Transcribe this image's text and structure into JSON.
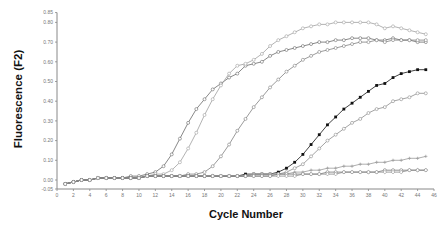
{
  "chart_data": {
    "type": "line",
    "title": "",
    "xlabel": "Cycle Number",
    "ylabel": "Fluorescence (F2)",
    "xlim": [
      0,
      46
    ],
    "ylim": [
      -0.05,
      0.85
    ],
    "grid": false,
    "legend": "none",
    "x_ticks": [
      0,
      2,
      4,
      6,
      8,
      10,
      12,
      14,
      16,
      18,
      20,
      22,
      24,
      26,
      28,
      30,
      32,
      34,
      36,
      38,
      40,
      42,
      44,
      46
    ],
    "x_tick_labels": [
      "0",
      "2",
      "4",
      "6",
      "8",
      "10",
      "12",
      "14",
      "16",
      "18",
      "20",
      "22",
      "24",
      "26",
      "28",
      "30",
      "32",
      "34",
      "36",
      "38",
      "40",
      "42",
      "44",
      "46"
    ],
    "y_ticks": [
      -0.05,
      0.0,
      0.1,
      0.2,
      0.3,
      0.4,
      0.5,
      0.6,
      0.7,
      0.8,
      0.85
    ],
    "y_tick_labels": [
      "-0.05",
      "0.00",
      "0.10",
      "0.20",
      "0.30",
      "0.40",
      "0.50",
      "0.60",
      "0.70",
      "0.80",
      "0.85"
    ],
    "x": [
      1,
      2,
      3,
      4,
      5,
      6,
      7,
      8,
      9,
      10,
      11,
      12,
      13,
      14,
      15,
      16,
      17,
      18,
      19,
      20,
      21,
      22,
      23,
      24,
      25,
      26,
      27,
      28,
      29,
      30,
      31,
      32,
      33,
      34,
      35,
      36,
      37,
      38,
      39,
      40,
      41,
      42,
      43,
      44,
      45
    ],
    "series": [
      {
        "name": "Sample A",
        "color": "#6a6a6a",
        "marker": "open-circle",
        "values": [
          -0.02,
          -0.01,
          0.0,
          0.0,
          0.01,
          0.01,
          0.01,
          0.01,
          0.02,
          0.02,
          0.03,
          0.04,
          0.07,
          0.13,
          0.21,
          0.29,
          0.36,
          0.41,
          0.46,
          0.49,
          0.52,
          0.54,
          0.58,
          0.59,
          0.6,
          0.63,
          0.65,
          0.66,
          0.67,
          0.68,
          0.69,
          0.7,
          0.7,
          0.71,
          0.71,
          0.72,
          0.72,
          0.72,
          0.71,
          0.71,
          0.72,
          0.71,
          0.71,
          0.7,
          0.7
        ]
      },
      {
        "name": "Sample B",
        "color": "#a0a0a0",
        "marker": "open-circle",
        "values": [
          -0.02,
          -0.01,
          0.0,
          0.0,
          0.01,
          0.01,
          0.01,
          0.01,
          0.01,
          0.02,
          0.02,
          0.03,
          0.03,
          0.05,
          0.09,
          0.16,
          0.24,
          0.33,
          0.41,
          0.48,
          0.54,
          0.58,
          0.59,
          0.61,
          0.64,
          0.68,
          0.71,
          0.73,
          0.75,
          0.77,
          0.78,
          0.79,
          0.79,
          0.8,
          0.8,
          0.8,
          0.8,
          0.8,
          0.79,
          0.77,
          0.78,
          0.77,
          0.76,
          0.75,
          0.74
        ]
      },
      {
        "name": "Sample C",
        "color": "#808080",
        "marker": "open-circle",
        "values": [
          -0.02,
          -0.01,
          0.0,
          0.0,
          0.01,
          0.01,
          0.01,
          0.01,
          0.01,
          0.01,
          0.02,
          0.02,
          0.02,
          0.02,
          0.02,
          0.03,
          0.03,
          0.04,
          0.07,
          0.12,
          0.18,
          0.25,
          0.31,
          0.37,
          0.42,
          0.47,
          0.51,
          0.55,
          0.58,
          0.61,
          0.63,
          0.65,
          0.66,
          0.67,
          0.68,
          0.69,
          0.7,
          0.7,
          0.71,
          0.7,
          0.71,
          0.71,
          0.71,
          0.71,
          0.71
        ]
      },
      {
        "name": "Sample D",
        "color": "#111111",
        "marker": "filled-square",
        "values": [
          -0.02,
          -0.01,
          0.0,
          0.0,
          0.01,
          0.01,
          0.01,
          0.01,
          0.01,
          0.01,
          0.02,
          0.02,
          0.02,
          0.02,
          0.02,
          0.02,
          0.02,
          0.02,
          0.02,
          0.02,
          0.02,
          0.02,
          0.03,
          0.03,
          0.03,
          0.03,
          0.04,
          0.06,
          0.09,
          0.13,
          0.18,
          0.23,
          0.28,
          0.32,
          0.36,
          0.39,
          0.42,
          0.45,
          0.48,
          0.49,
          0.52,
          0.54,
          0.55,
          0.56,
          0.56
        ]
      },
      {
        "name": "Sample E",
        "color": "#8c8c8c",
        "marker": "open-circle",
        "values": [
          -0.02,
          -0.01,
          0.0,
          0.0,
          0.01,
          0.01,
          0.01,
          0.01,
          0.01,
          0.01,
          0.02,
          0.02,
          0.02,
          0.02,
          0.02,
          0.02,
          0.02,
          0.02,
          0.02,
          0.02,
          0.02,
          0.02,
          0.02,
          0.03,
          0.03,
          0.03,
          0.03,
          0.04,
          0.06,
          0.08,
          0.12,
          0.16,
          0.2,
          0.23,
          0.26,
          0.29,
          0.31,
          0.34,
          0.36,
          0.37,
          0.4,
          0.41,
          0.42,
          0.44,
          0.44
        ]
      },
      {
        "name": "Sample F",
        "color": "#9a9a9a",
        "marker": "plus",
        "values": [
          -0.02,
          -0.01,
          0.0,
          0.0,
          0.01,
          0.01,
          0.01,
          0.01,
          0.01,
          0.01,
          0.02,
          0.02,
          0.02,
          0.02,
          0.02,
          0.02,
          0.02,
          0.02,
          0.02,
          0.02,
          0.02,
          0.02,
          0.02,
          0.03,
          0.03,
          0.03,
          0.03,
          0.03,
          0.04,
          0.04,
          0.05,
          0.05,
          0.06,
          0.06,
          0.07,
          0.07,
          0.08,
          0.08,
          0.09,
          0.09,
          0.1,
          0.1,
          0.11,
          0.11,
          0.12
        ]
      },
      {
        "name": "Sample G",
        "color": "#777777",
        "marker": "open-circle",
        "values": [
          -0.02,
          -0.01,
          0.0,
          0.0,
          0.01,
          0.01,
          0.01,
          0.01,
          0.01,
          0.01,
          0.02,
          0.02,
          0.02,
          0.02,
          0.02,
          0.02,
          0.02,
          0.02,
          0.02,
          0.02,
          0.02,
          0.02,
          0.02,
          0.02,
          0.02,
          0.02,
          0.03,
          0.03,
          0.03,
          0.03,
          0.03,
          0.03,
          0.04,
          0.04,
          0.04,
          0.04,
          0.04,
          0.04,
          0.04,
          0.05,
          0.05,
          0.05,
          0.05,
          0.05,
          0.05
        ]
      },
      {
        "name": "Sample H",
        "color": "#8a8a8a",
        "marker": "open-diamond",
        "values": [
          -0.02,
          -0.01,
          0.0,
          0.0,
          0.01,
          0.01,
          0.01,
          0.01,
          0.01,
          0.01,
          0.02,
          0.02,
          0.02,
          0.02,
          0.02,
          0.02,
          0.02,
          0.02,
          0.02,
          0.02,
          0.02,
          0.02,
          0.02,
          0.02,
          0.02,
          0.02,
          0.02,
          0.02,
          0.02,
          0.03,
          0.03,
          0.03,
          0.03,
          0.03,
          0.04,
          0.04,
          0.04,
          0.04,
          0.04,
          0.04,
          0.04,
          0.04,
          0.05,
          0.05,
          0.05
        ]
      }
    ]
  }
}
